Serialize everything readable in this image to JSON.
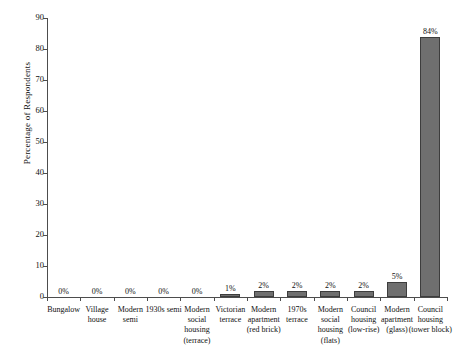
{
  "chart_data": {
    "type": "bar",
    "title": "",
    "xlabel": "",
    "ylabel": "Percentage of Respondents",
    "ylim": [
      0,
      90
    ],
    "yticks": [
      0,
      10,
      20,
      30,
      40,
      50,
      60,
      70,
      80,
      90
    ],
    "grid": false,
    "legend": "none",
    "categories": [
      "Bungalow",
      "Village house",
      "Modern semi",
      "1930s semi",
      "Modern social housing (terrace)",
      "Victorian terrace",
      "Modern apartment (red brick)",
      "1970s terrace",
      "Modern social housing (flats)",
      "Council housing (low-rise)",
      "Modern apartment (glass)",
      "Council housing (tower block)"
    ],
    "category_lines": [
      [
        "Bungalow"
      ],
      [
        "Village",
        "house"
      ],
      [
        "Modern",
        "semi"
      ],
      [
        "1930s semi"
      ],
      [
        "Modern",
        "social housing",
        "(terrace)"
      ],
      [
        "Victorian",
        "terrace"
      ],
      [
        "Modern",
        "apartment",
        "(red brick)"
      ],
      [
        "1970s",
        "terrace"
      ],
      [
        "Modern",
        "social housing",
        "(flats)"
      ],
      [
        "Council",
        "housing",
        "(low-rise)"
      ],
      [
        "Modern",
        "apartment",
        "(glass)"
      ],
      [
        "Council",
        "housing",
        "(tower block)"
      ]
    ],
    "values": [
      0,
      0,
      0,
      0,
      0,
      1,
      2,
      2,
      2,
      2,
      5,
      84
    ],
    "value_labels": [
      "0%",
      "0%",
      "0%",
      "0%",
      "0%",
      "1%",
      "2%",
      "2%",
      "2%",
      "2%",
      "5%",
      "84%"
    ],
    "bar_color": "#6f6f6f",
    "bar_edge_color": "#3d3d3d",
    "axis_color": "#4d4d4d",
    "text_color": "#111111"
  }
}
